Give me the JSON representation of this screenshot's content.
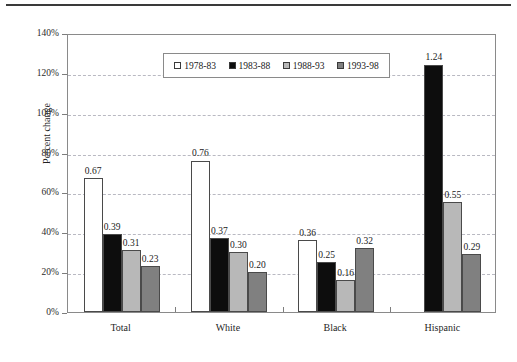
{
  "chart_data": {
    "type": "bar",
    "title": "",
    "subtitle": "",
    "xlabel": "",
    "ylabel": "Percent change",
    "categories": [
      "Total",
      "White",
      "Black",
      "Hispanic"
    ],
    "series": [
      {
        "name": "1978-83",
        "color": "#ffffff",
        "values": [
          0.67,
          0.76,
          0.36,
          null
        ],
        "labels": [
          "0.67",
          "0.76",
          "0.36",
          ""
        ]
      },
      {
        "name": "1983-88",
        "color": "#0d0d0d",
        "values": [
          0.39,
          0.37,
          0.25,
          1.24
        ],
        "labels": [
          "0.39",
          "0.37",
          "0.25",
          "1.24"
        ]
      },
      {
        "name": "1988-93",
        "color": "#b8b8b8",
        "values": [
          0.31,
          0.3,
          0.16,
          0.55
        ],
        "labels": [
          "0.31",
          "0.30",
          "0.16",
          "0.55"
        ]
      },
      {
        "name": "1993-98",
        "color": "#808080",
        "values": [
          0.23,
          0.2,
          0.32,
          0.29
        ],
        "labels": [
          "0.23",
          "0.20",
          "0.32",
          "0.29"
        ]
      }
    ],
    "ylim": [
      0,
      1.4
    ],
    "ytick_values": [
      0,
      0.2,
      0.4,
      0.6,
      0.8,
      1.0,
      1.2,
      1.4
    ],
    "ytick_labels": [
      "0%",
      "20%",
      "40%",
      "60%",
      "80%",
      "100%",
      "120%",
      "140%"
    ],
    "grid": true,
    "grid_style": "dashed",
    "grid_color": "#b9b9c2",
    "legend_position": "top-center",
    "axis_color": "#8a8a8a",
    "background": "#ffffff"
  },
  "legend": {
    "items": [
      {
        "label": "1978-83",
        "color": "#ffffff"
      },
      {
        "label": "1983-88",
        "color": "#0d0d0d"
      },
      {
        "label": "1988-93",
        "color": "#b8b8b8"
      },
      {
        "label": "1993-98",
        "color": "#808080"
      }
    ]
  }
}
